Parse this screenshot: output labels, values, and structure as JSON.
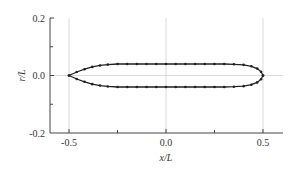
{
  "chart_data": {
    "type": "line",
    "title": "",
    "xlabel": "x/L",
    "ylabel": "r/L",
    "xlim": [
      -0.6,
      0.6
    ],
    "ylim": [
      -0.2,
      0.2
    ],
    "x_ticks": [
      "-0.5",
      "0.0",
      "0.5"
    ],
    "y_ticks": [
      "0.2",
      "0.0",
      "-0.2"
    ],
    "grid": {
      "vertical_at": [
        -0.5,
        0.0,
        0.5
      ],
      "horizontal_at": [
        0.0
      ]
    },
    "legend": null,
    "series": [
      {
        "name": "body profile (upper)",
        "marker": "dot",
        "x": [
          -0.5,
          -0.46,
          -0.42,
          -0.38,
          -0.34,
          -0.3,
          -0.25,
          -0.2,
          -0.15,
          -0.1,
          -0.05,
          0.0,
          0.05,
          0.1,
          0.15,
          0.2,
          0.25,
          0.3,
          0.35,
          0.4,
          0.44,
          0.47,
          0.49,
          0.5
        ],
        "y": [
          0.0,
          0.012,
          0.022,
          0.03,
          0.035,
          0.038,
          0.04,
          0.04,
          0.04,
          0.04,
          0.04,
          0.04,
          0.04,
          0.04,
          0.04,
          0.04,
          0.04,
          0.04,
          0.039,
          0.037,
          0.032,
          0.024,
          0.013,
          0.0
        ]
      },
      {
        "name": "body profile (lower)",
        "marker": "dot",
        "x": [
          -0.5,
          -0.46,
          -0.42,
          -0.38,
          -0.34,
          -0.3,
          -0.25,
          -0.2,
          -0.15,
          -0.1,
          -0.05,
          0.0,
          0.05,
          0.1,
          0.15,
          0.2,
          0.25,
          0.3,
          0.35,
          0.4,
          0.44,
          0.47,
          0.49,
          0.5
        ],
        "y": [
          0.0,
          -0.012,
          -0.022,
          -0.03,
          -0.035,
          -0.038,
          -0.04,
          -0.04,
          -0.04,
          -0.04,
          -0.04,
          -0.04,
          -0.04,
          -0.04,
          -0.04,
          -0.04,
          -0.04,
          -0.04,
          -0.039,
          -0.037,
          -0.032,
          -0.024,
          -0.013,
          0.0
        ]
      }
    ]
  },
  "axes": {
    "xlabel": "x/L",
    "ylabel": "r/L",
    "xticks": {
      "a": "-0.5",
      "b": "0.0",
      "c": "0.5"
    },
    "yticks": {
      "a": "0.2",
      "b": "0.0",
      "c": "-0.2"
    }
  },
  "colors": {
    "line": "#222222",
    "grid": "#cccccc",
    "axis": "#444444"
  }
}
